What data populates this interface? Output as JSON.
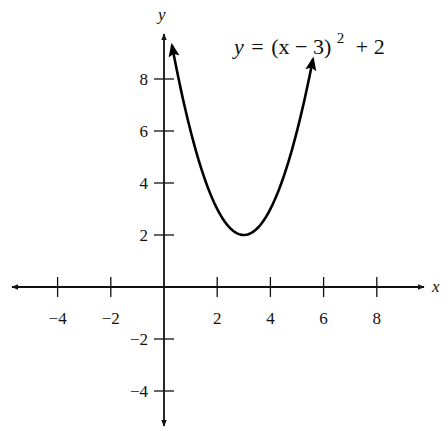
{
  "chart_data": {
    "type": "line",
    "equation": {
      "lhs": "y",
      "eq": "=",
      "base": "(x − 3)",
      "exponent": "2",
      "tail": "+ 2"
    },
    "xlabel": "x",
    "ylabel": "y",
    "xlim": [
      -5.8,
      9.8
    ],
    "ylim": [
      -5.4,
      9.6
    ],
    "x_ticks": [
      -4,
      -2,
      2,
      4,
      6,
      8
    ],
    "y_ticks": [
      -4,
      -2,
      2,
      4,
      6,
      8
    ],
    "x_tick_labels": [
      "−4",
      "−2",
      "2",
      "4",
      "6",
      "8"
    ],
    "y_tick_labels": [
      "−4",
      "−2",
      "2",
      "4",
      "6",
      "8"
    ],
    "grid": false,
    "legend": null,
    "series": [
      {
        "name": "y = (x − 3)^2 + 2",
        "function": "(x-3)^2+2",
        "x_range": [
          0.3,
          5.6
        ],
        "vertex": [
          3,
          2
        ],
        "arrows_at_ends": true,
        "points": [
          [
            0.3,
            9.29
          ],
          [
            1,
            6
          ],
          [
            2,
            3
          ],
          [
            3,
            2
          ],
          [
            4,
            3
          ],
          [
            5,
            6
          ],
          [
            5.6,
            8.76
          ]
        ]
      }
    ]
  },
  "colors": {
    "axis": "#111111",
    "curve": "#000000",
    "background": "#ffffff"
  }
}
